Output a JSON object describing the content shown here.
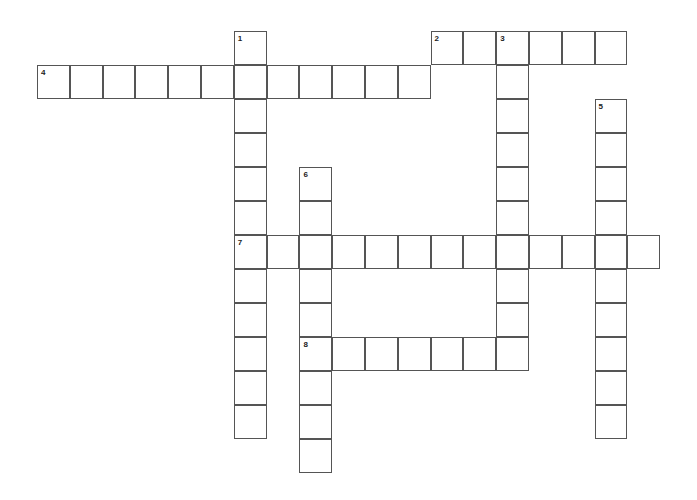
{
  "puzzle": {
    "origin_x": 37,
    "origin_y": 31,
    "cell_w": 32.8,
    "cell_h": 34,
    "words": [
      {
        "number": "1",
        "direction": "down",
        "row": 0,
        "col": 6,
        "length": 12
      },
      {
        "number": "2",
        "direction": "across",
        "row": 0,
        "col": 12,
        "length": 6
      },
      {
        "number": "3",
        "direction": "down",
        "row": 0,
        "col": 14,
        "length": 10
      },
      {
        "number": "4",
        "direction": "across",
        "row": 1,
        "col": 0,
        "length": 12
      },
      {
        "number": "5",
        "direction": "down",
        "row": 2,
        "col": 17,
        "length": 10
      },
      {
        "number": "6",
        "direction": "down",
        "row": 4,
        "col": 8,
        "length": 9
      },
      {
        "number": "7",
        "direction": "across",
        "row": 6,
        "col": 6,
        "length": 13
      },
      {
        "number": "8",
        "direction": "across",
        "row": 9,
        "col": 8,
        "length": 7
      }
    ]
  }
}
